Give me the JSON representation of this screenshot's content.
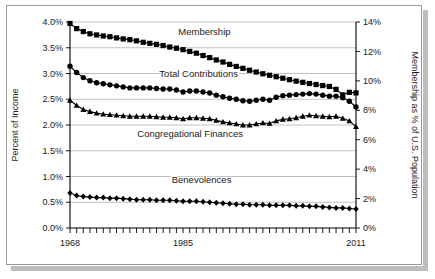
{
  "chart_data": {
    "type": "line",
    "title": "",
    "subtitle": "",
    "xlabel": "",
    "ylabel": "Percent of Income",
    "y2label": "Membership as % of U.S. Population",
    "xlim": [
      1968,
      2011
    ],
    "ylim": [
      0.0,
      4.0
    ],
    "y2lim": [
      0,
      14
    ],
    "grid": true,
    "legend_position": "inline-annotations",
    "x_tick_labels": [
      "1968",
      "1985",
      "2011"
    ],
    "x_tick_values": [
      1968,
      1985,
      2011
    ],
    "x_minor_ticks_every": 1,
    "y_tick_labels": [
      "0.0%",
      "0.5%",
      "1.0%",
      "1.5%",
      "2.0%",
      "2.5%",
      "3.0%",
      "3.5%",
      "4.0%"
    ],
    "y_tick_values": [
      0.0,
      0.5,
      1.0,
      1.5,
      2.0,
      2.5,
      3.0,
      3.5,
      4.0
    ],
    "y2_tick_labels": [
      "0%",
      "2%",
      "4%",
      "6%",
      "8%",
      "10%",
      "12%",
      "14%"
    ],
    "y2_tick_values": [
      0,
      2,
      4,
      6,
      8,
      10,
      12,
      14
    ],
    "x": [
      1968,
      1969,
      1970,
      1971,
      1972,
      1973,
      1974,
      1975,
      1976,
      1977,
      1978,
      1979,
      1980,
      1981,
      1982,
      1983,
      1984,
      1985,
      1986,
      1987,
      1988,
      1989,
      1990,
      1991,
      1992,
      1993,
      1994,
      1995,
      1996,
      1997,
      1998,
      1999,
      2000,
      2001,
      2002,
      2003,
      2004,
      2005,
      2006,
      2007,
      2008,
      2009,
      2010,
      2011
    ],
    "series": [
      {
        "name": "Membership",
        "axis": "right",
        "marker": "square",
        "units": "% of U.S. Population",
        "values": [
          13.9,
          13.55,
          13.35,
          13.2,
          13.12,
          13.05,
          13.0,
          12.92,
          12.85,
          12.8,
          12.72,
          12.62,
          12.55,
          12.48,
          12.4,
          12.3,
          12.22,
          12.12,
          12.0,
          11.88,
          11.72,
          11.58,
          11.42,
          11.28,
          11.12,
          10.98,
          10.85,
          10.72,
          10.6,
          10.48,
          10.38,
          10.28,
          10.18,
          10.08,
          9.98,
          9.9,
          9.82,
          9.75,
          9.68,
          9.62,
          9.42,
          9.05,
          9.22,
          9.18
        ]
      },
      {
        "name": "Total Contributions",
        "axis": "left",
        "marker": "circle",
        "units": "Percent of Income",
        "values": [
          3.14,
          3.02,
          2.92,
          2.86,
          2.82,
          2.8,
          2.78,
          2.76,
          2.74,
          2.72,
          2.72,
          2.72,
          2.72,
          2.71,
          2.7,
          2.7,
          2.68,
          2.64,
          2.66,
          2.66,
          2.64,
          2.62,
          2.58,
          2.55,
          2.52,
          2.5,
          2.47,
          2.46,
          2.48,
          2.5,
          2.48,
          2.54,
          2.57,
          2.58,
          2.59,
          2.6,
          2.61,
          2.6,
          2.58,
          2.56,
          2.56,
          2.53,
          2.46,
          2.35
        ]
      },
      {
        "name": "Congregational Finances",
        "axis": "left",
        "marker": "triangle",
        "units": "Percent of Income",
        "values": [
          2.48,
          2.38,
          2.3,
          2.26,
          2.23,
          2.21,
          2.2,
          2.19,
          2.18,
          2.17,
          2.17,
          2.17,
          2.17,
          2.16,
          2.15,
          2.15,
          2.14,
          2.12,
          2.14,
          2.14,
          2.13,
          2.12,
          2.09,
          2.06,
          2.04,
          2.02,
          2.0,
          2.0,
          2.02,
          2.04,
          2.03,
          2.08,
          2.11,
          2.12,
          2.14,
          2.17,
          2.19,
          2.18,
          2.17,
          2.16,
          2.17,
          2.13,
          2.08,
          1.97
        ]
      },
      {
        "name": "Benevolences",
        "axis": "left",
        "marker": "diamond",
        "units": "Percent of Income",
        "values": [
          0.68,
          0.63,
          0.61,
          0.6,
          0.59,
          0.59,
          0.58,
          0.58,
          0.57,
          0.56,
          0.55,
          0.55,
          0.55,
          0.54,
          0.54,
          0.54,
          0.53,
          0.52,
          0.52,
          0.52,
          0.51,
          0.5,
          0.49,
          0.48,
          0.47,
          0.46,
          0.46,
          0.45,
          0.45,
          0.45,
          0.44,
          0.44,
          0.44,
          0.44,
          0.43,
          0.43,
          0.42,
          0.42,
          0.41,
          0.4,
          0.39,
          0.39,
          0.38,
          0.37
        ]
      }
    ],
    "annotations": [
      {
        "text": "Membership",
        "x_frac": 0.47,
        "y_px": 35
      },
      {
        "text": "Total Contributions",
        "x_frac": 0.45,
        "y_px": 77
      },
      {
        "text": "Congregational Finances",
        "x_frac": 0.42,
        "y_px": 137
      },
      {
        "text": "Benevolences",
        "x_frac": 0.46,
        "y_px": 183
      }
    ],
    "colors": {
      "series": "#000000",
      "grid": "#b0b0b0",
      "axis": "#000000",
      "background": "#ffffff",
      "frame": "#9a9a9a",
      "shadow": "#bdbdbd"
    }
  }
}
